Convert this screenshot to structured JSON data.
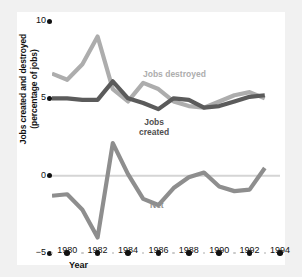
{
  "chart_data": {
    "type": "line",
    "title": "",
    "xlabel": "Year",
    "ylabel": "Jobs created and destroyed (percentage of jobs)",
    "ylabel_line1": "Jobs created and destroyed",
    "ylabel_line2": "(percentage of jobs)",
    "xlim": [
      1979,
      1994
    ],
    "ylim": [
      -5,
      10
    ],
    "yticks": [
      10,
      5,
      0,
      -5
    ],
    "ytick_labels": [
      "10",
      "5",
      "0",
      "−5"
    ],
    "xticks": [
      1980,
      1982,
      1984,
      1986,
      1988,
      1990,
      1992,
      1994
    ],
    "xtick_labels": [
      "1980",
      "1982",
      "1984",
      "1986",
      "1988",
      "1990",
      "1992",
      "1994"
    ],
    "minor_xticks": [
      1979,
      1981,
      1983,
      1985,
      1987,
      1989,
      1991,
      1993
    ],
    "grid": false,
    "zero_line": true,
    "legend_position": "inline-annotations",
    "x": [
      1979,
      1980,
      1981,
      1982,
      1983,
      1984,
      1985,
      1986,
      1987,
      1988,
      1989,
      1990,
      1991,
      1992,
      1993
    ],
    "series": [
      {
        "name": "Jobs destroyed",
        "color": "#adadad",
        "values": [
          6.6,
          6.2,
          7.2,
          9.0,
          5.6,
          4.8,
          6.0,
          5.6,
          4.8,
          4.5,
          4.4,
          4.8,
          5.2,
          5.4,
          5.0
        ]
      },
      {
        "name": "Jobs created",
        "color": "#5b5b5b",
        "values": [
          5.0,
          5.0,
          4.9,
          4.9,
          6.1,
          5.0,
          4.7,
          4.3,
          5.0,
          4.9,
          4.4,
          4.5,
          4.8,
          5.1,
          5.2
        ]
      },
      {
        "name": "Net",
        "color": "#8e8e8e",
        "values": [
          -1.3,
          -1.2,
          -2.2,
          -4.0,
          2.1,
          0.1,
          -1.5,
          -1.9,
          -0.8,
          -0.1,
          0.2,
          -0.7,
          -1.0,
          -0.9,
          0.5
        ]
      }
    ],
    "annotations": [
      {
        "text": "Jobs destroyed",
        "series": "Jobs destroyed"
      },
      {
        "text": "Jobs",
        "text2": "created",
        "series": "Jobs created"
      },
      {
        "text": "Net",
        "series": "Net"
      }
    ]
  },
  "annotations": {
    "destroyed": "Jobs destroyed",
    "created_line1": "Jobs",
    "created_line2": "created",
    "net": "Net"
  },
  "colors": {
    "destroyed": "#adadad",
    "created": "#5b5b5b",
    "net": "#8e8e8e",
    "axis": "#111111",
    "zero_line": "#d5d5d5",
    "background": "#ffffff",
    "page_background": "#f1f1f1"
  }
}
